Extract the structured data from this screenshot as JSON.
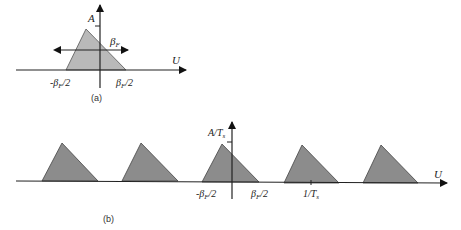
{
  "figure_a": {
    "caption": "(a)",
    "y_label": "A",
    "x_label": "U",
    "width_label": "β",
    "width_label_sub": "F",
    "left_tick": "-β",
    "left_tick_sub": "F",
    "left_tick_tail": "/2",
    "right_tick": "β",
    "right_tick_sub": "F",
    "right_tick_tail": "/2",
    "fill_color": "#b9b9b9"
  },
  "figure_b": {
    "caption": "(b)",
    "y_label": "A/T",
    "y_label_sub": "s",
    "x_label": "U",
    "left_tick": "-β",
    "left_tick_sub": "F",
    "left_tick_tail": "/2",
    "right_tick": "β",
    "right_tick_sub": "F",
    "right_tick_tail": "/2",
    "period_tick": "1/T",
    "period_tick_sub": "s",
    "replica_count": 5,
    "fill_color": "#8c8c8c"
  }
}
